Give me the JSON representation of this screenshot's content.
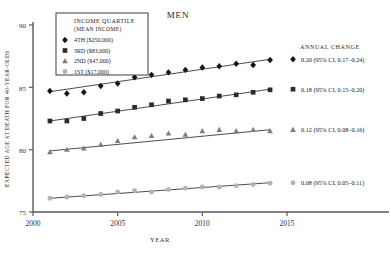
{
  "chart_data": {
    "type": "scatter",
    "title": "Men",
    "xlabel": "Year",
    "ylabel": "Expected Age at Death for 40-Year-Olds",
    "xlim": [
      2000,
      2015
    ],
    "ylim": [
      75,
      90
    ],
    "xticks": [
      "2000",
      "2005",
      "2010",
      "2015"
    ],
    "xtick_values": [
      2000,
      2005,
      2010,
      2015
    ],
    "yticks": [
      "75",
      "80",
      "85",
      "90"
    ],
    "ytick_values": [
      75,
      80,
      85,
      90
    ],
    "grid": false,
    "legend_position": "top-left",
    "legend_title_line1": "Income Quartile",
    "legend_title_line2": "(Mean Income)",
    "annotation_header": "Annual Change",
    "x": [
      2001,
      2002,
      2003,
      2004,
      2005,
      2006,
      2007,
      2008,
      2009,
      2010,
      2011,
      2012,
      2013,
      2014
    ],
    "series": [
      {
        "name": "4th ($250,000)",
        "marker": "diamond",
        "color": "#151515",
        "annual_change": "0.20 (95% CI, 0.17–0.24)",
        "values": [
          84.7,
          84.5,
          84.6,
          85.1,
          85.3,
          85.8,
          86.0,
          86.2,
          86.4,
          86.6,
          86.7,
          86.9,
          86.8,
          87.2
        ],
        "fit_start": 84.65,
        "fit_end": 87.25
      },
      {
        "name": "3rd ($83,000)",
        "marker": "square",
        "color": "#2b2b2b",
        "annual_change": "0.18 (95% CI, 0.15–0.20)",
        "values": [
          82.3,
          82.3,
          82.5,
          82.9,
          83.1,
          83.4,
          83.6,
          83.9,
          84.0,
          84.1,
          84.3,
          84.4,
          84.6,
          84.8
        ],
        "fit_start": 82.3,
        "fit_end": 84.85
      },
      {
        "name": "2nd ($47,000)",
        "marker": "triangle",
        "color": "#7d7d7d",
        "annual_change": "0.12 (95% CI, 0.08–0.16)",
        "values": [
          79.8,
          80.0,
          80.1,
          80.4,
          80.7,
          81.0,
          81.1,
          81.3,
          81.2,
          81.5,
          81.6,
          81.5,
          81.6,
          81.5
        ],
        "fit_start": 79.9,
        "fit_end": 81.6
      },
      {
        "name": "1st ($17,000)",
        "marker": "circle",
        "color": "#b4b4b4",
        "annual_change": "0.08 (95% CI, 0.05–0.11)",
        "values": [
          76.1,
          76.2,
          76.3,
          76.4,
          76.6,
          76.7,
          76.6,
          76.8,
          76.9,
          77.0,
          77.0,
          77.1,
          77.2,
          77.3
        ],
        "fit_start": 76.1,
        "fit_end": 77.35
      }
    ]
  }
}
